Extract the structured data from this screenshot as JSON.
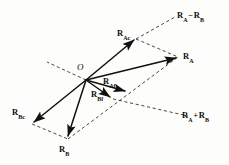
{
  "figure": {
    "type": "vector-decomposition-diagram",
    "background_color": "#fdfdfb",
    "stroke_color": "#111111",
    "origin_label": "O"
  },
  "labels": {
    "origin": "O",
    "r_ac": {
      "base": "R",
      "sub": "Ac"
    },
    "r_a": {
      "base": "R",
      "sub": "A"
    },
    "r_af": {
      "base": "R",
      "sub": "Af"
    },
    "r_bf": {
      "base": "R",
      "sub": "Bf"
    },
    "r_bc": {
      "base": "R",
      "sub": "Bc"
    },
    "r_b": {
      "base": "R",
      "sub": "B"
    },
    "r_a_minus_r_b": {
      "first_base": "R",
      "first_sub": "A",
      "operator": "−",
      "second_base": "R",
      "second_sub": "B"
    },
    "r_a_plus_r_b": {
      "first_base": "R",
      "first_sub": "A",
      "operator": "+",
      "second_base": "R",
      "second_sub": "B"
    }
  },
  "geometry": {
    "origin_point": [
      86,
      80
    ],
    "solid_vectors": [
      {
        "name": "R_Ac",
        "from": [
          86,
          80
        ],
        "to": [
          136,
          39
        ]
      },
      {
        "name": "R_A",
        "from": [
          86,
          80
        ],
        "to": [
          179,
          57
        ]
      },
      {
        "name": "R_Af",
        "from": [
          86,
          80
        ],
        "to": [
          128,
          92
        ]
      },
      {
        "name": "R_Bf",
        "from": [
          86,
          80
        ],
        "to": [
          113,
          99
        ]
      },
      {
        "name": "R_Bc",
        "from": [
          86,
          80
        ],
        "to": [
          32,
          124
        ]
      },
      {
        "name": "R_B",
        "from": [
          86,
          80
        ],
        "to": [
          67,
          139
        ]
      }
    ],
    "dashed_lines": [
      {
        "name": "axis-upper-left",
        "from": [
          86,
          80
        ],
        "to": [
          47,
          62
        ]
      },
      {
        "name": "diff-diagonal",
        "from": [
          136,
          39
        ],
        "to": [
          175,
          17
        ]
      },
      {
        "name": "parallel-ac-to-a",
        "from": [
          136,
          39
        ],
        "to": [
          179,
          57
        ]
      },
      {
        "name": "sum-diagonal",
        "from": [
          113,
          99
        ],
        "to": [
          188,
          116
        ]
      },
      {
        "name": "parallel-b-to-a",
        "from": [
          67,
          139
        ],
        "to": [
          179,
          57
        ]
      },
      {
        "name": "parallel-bc-b",
        "from": [
          32,
          124
        ],
        "to": [
          67,
          139
        ]
      }
    ]
  }
}
